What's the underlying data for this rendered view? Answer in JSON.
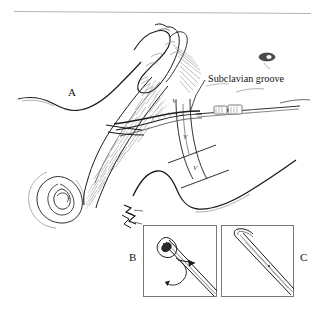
{
  "figure": {
    "background_color": "#ffffff",
    "ink_color": "#1a1a1a",
    "width": 323,
    "height": 309,
    "top_rule": true
  },
  "labels": {
    "panel_a": "A",
    "panel_b": "B",
    "panel_c": "C",
    "subclavian_groove": "Subclavian groove"
  },
  "markers": {
    "v1": "V",
    "v2": "V",
    "v3": "V"
  },
  "panels": [
    {
      "id": "A",
      "letter": "A",
      "description": "Overview: head turned, hand palpating the clavicle, needle and catheter hub entering at the subclavian groove"
    },
    {
      "id": "B",
      "letter": "B",
      "description": "Inset close-up: needle tip with bevel opening, rotation arrow and advance arrow"
    },
    {
      "id": "C",
      "letter": "C",
      "description": "Inset close-up: needle shown with bevel facing away"
    }
  ],
  "annotations": {
    "leader_line": "leader from Subclavian groove label to groove landmark",
    "zigzag_markers": "entry site markers connecting panel A to inset B"
  }
}
